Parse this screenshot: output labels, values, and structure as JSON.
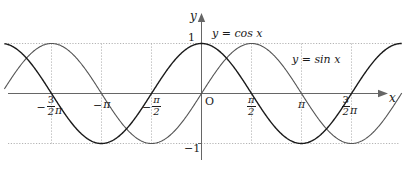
{
  "figure": {
    "kind": "trigonometric-graph",
    "background_color": "#ffffff",
    "axis_color": "#555555",
    "grid_color": "#bbbbbb",
    "curve_color": "#1a1a1a"
  },
  "axes": {
    "x_axis_label": "x",
    "y_axis_label": "y",
    "origin_label": "O",
    "y_tick_top": "1",
    "y_tick_bottom": "−1",
    "x_ticks": [
      {
        "id": "neg-3pi-2",
        "minus": "−",
        "numerator": "3",
        "denominator": "2",
        "pi": "π",
        "value": -4.71238898038469
      },
      {
        "id": "neg-pi",
        "minus": "−",
        "pi": "π",
        "value": -3.141592653589793
      },
      {
        "id": "neg-pi-2",
        "minus": "−",
        "numerator": "π",
        "denominator": "2",
        "value": -1.570796326794897
      },
      {
        "id": "pos-pi-2",
        "numerator": "π",
        "denominator": "2",
        "value": 1.570796326794897
      },
      {
        "id": "pos-pi",
        "pi": "π",
        "value": 3.141592653589793
      },
      {
        "id": "pos-3pi-2",
        "numerator": "3",
        "denominator": "2",
        "pi": "π",
        "value": 4.71238898038469
      }
    ]
  },
  "curve_labels": {
    "cos_label": "y = cos x",
    "sin_label": "y = sin x"
  },
  "chart_data": {
    "type": "line",
    "title": "",
    "xlabel": "x",
    "ylabel": "y",
    "xlim": [
      -6.4,
      6.8
    ],
    "ylim": [
      -1.35,
      1.35
    ],
    "grid": true,
    "grid_lines": {
      "horizontal": [
        1,
        -1
      ],
      "vertical": [
        -4.71238898038469,
        -3.141592653589793,
        -1.570796326794897,
        1.570796326794897,
        3.141592653589793,
        4.71238898038469
      ]
    },
    "legend": "inline-annotations",
    "x_tick_labels": [
      "-3π/2",
      "-π",
      "-π/2",
      "O",
      "π/2",
      "π",
      "3π/2"
    ],
    "y_tick_labels": [
      "1",
      "-1"
    ],
    "series": [
      {
        "name": "y = cos x",
        "formula": "cos",
        "amplitude": 1,
        "period": 6.283185307179586,
        "phase": 0,
        "color": "#1a1a1a",
        "width": 1.4,
        "key_points": [
          {
            "x": -6.283185307179586,
            "y": 1
          },
          {
            "x": -4.71238898038469,
            "y": 0
          },
          {
            "x": -3.141592653589793,
            "y": -1
          },
          {
            "x": -1.570796326794897,
            "y": 0
          },
          {
            "x": 0,
            "y": 1
          },
          {
            "x": 1.570796326794897,
            "y": 0
          },
          {
            "x": 3.141592653589793,
            "y": -1
          },
          {
            "x": 4.71238898038469,
            "y": 0
          },
          {
            "x": 6.283185307179586,
            "y": 1
          }
        ]
      },
      {
        "name": "y = sin x",
        "formula": "sin",
        "amplitude": 1,
        "period": 6.283185307179586,
        "phase": 0,
        "color": "#555555",
        "width": 1.1,
        "key_points": [
          {
            "x": -6.283185307179586,
            "y": 0
          },
          {
            "x": -4.71238898038469,
            "y": 1
          },
          {
            "x": -3.141592653589793,
            "y": 0
          },
          {
            "x": -1.570796326794897,
            "y": -1
          },
          {
            "x": 0,
            "y": 0
          },
          {
            "x": 1.570796326794897,
            "y": 1
          },
          {
            "x": 3.141592653589793,
            "y": 0
          },
          {
            "x": 4.71238898038469,
            "y": -1
          },
          {
            "x": 6.283185307179586,
            "y": 0
          }
        ]
      }
    ]
  }
}
